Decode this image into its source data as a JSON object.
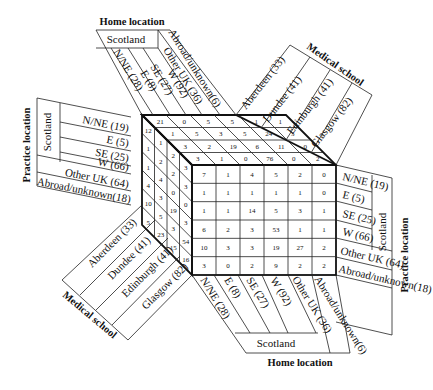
{
  "axes": {
    "home_location": {
      "title": "Home location",
      "group": "Scotland",
      "categories": [
        "N/NE (28)",
        "E (8)",
        "SE (27)",
        "W (92)",
        "Other UK (36)",
        "Abroad/unknown(6)"
      ]
    },
    "practice_location": {
      "title": "Practice location",
      "group": "Scotland",
      "categories": [
        "N/NE (19)",
        "E (5)",
        "SE (25)",
        "W (66)",
        "Other UK (64)",
        "Abroad/unknown(18)"
      ]
    },
    "medical_school": {
      "title": "Medical school",
      "categories": [
        "Aberdeen (33)",
        "Dundee (41)",
        "Edinburgh (41)",
        "Glasgow (82)"
      ]
    }
  },
  "faces": {
    "front_practice_by_home": [
      [
        "7",
        "1",
        "4",
        "5",
        "2",
        "0"
      ],
      [
        "1",
        "1",
        "1",
        "1",
        "1",
        "0"
      ],
      [
        "1",
        "1",
        "14",
        "5",
        "3",
        "1"
      ],
      [
        "6",
        "2",
        "3",
        "53",
        "1",
        "1"
      ],
      [
        "10",
        "3",
        "3",
        "19",
        "27",
        "2"
      ],
      [
        "3",
        "0",
        "2",
        "9",
        "2",
        "2"
      ]
    ],
    "top_school_by_home": [
      [
        "21",
        "0",
        "5",
        "5",
        "1",
        "1"
      ],
      [
        "1",
        "5",
        "3",
        "5",
        "24",
        "3"
      ],
      [
        "3",
        "2",
        "19",
        "6",
        "11",
        "0"
      ],
      [
        "3",
        "1",
        "0",
        "76",
        "0",
        "2"
      ]
    ],
    "left_practice_by_school": [
      [
        "12",
        "1",
        "2",
        "3"
      ],
      [
        "1",
        "2",
        "2",
        "3"
      ],
      [
        "1",
        "4",
        "0",
        "0"
      ],
      [
        "4",
        "3",
        "19",
        "3"
      ],
      [
        "10",
        "5",
        "3",
        "54"
      ],
      [
        "5",
        "23",
        "15",
        "16"
      ]
    ],
    "left_bottom_extra": [
      "4",
      "2",
      "7"
    ]
  }
}
